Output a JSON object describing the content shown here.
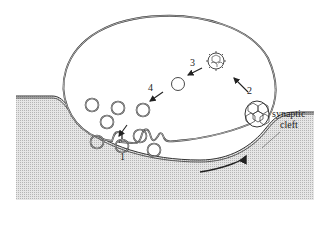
{
  "diagram": {
    "labels": {
      "step1": "1",
      "step2": "2",
      "step3": "3",
      "step4": "4",
      "cleft_line1": "synaptic",
      "cleft_line2": "cleft"
    },
    "colors": {
      "line": "#333333",
      "postsynaptic_fill": "#d9d9d9",
      "background": "#ffffff"
    }
  }
}
